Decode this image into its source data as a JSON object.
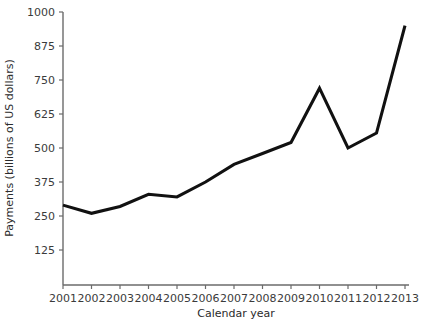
{
  "chart_data": {
    "type": "line",
    "title": "",
    "xlabel": "Calendar year",
    "ylabel": "Payments (billions of US dollars)",
    "categories": [
      "2001",
      "2002",
      "2003",
      "2004",
      "2005",
      "2006",
      "2007",
      "2008",
      "2009",
      "2010",
      "2011",
      "2012",
      "2013"
    ],
    "x": [
      2001,
      2002,
      2003,
      2004,
      2005,
      2006,
      2007,
      2008,
      2009,
      2010,
      2011,
      2012,
      2013
    ],
    "values": [
      290,
      260,
      285,
      330,
      320,
      375,
      440,
      480,
      520,
      720,
      500,
      555,
      950
    ],
    "series": [
      {
        "name": "Payments",
        "values": [
          290,
          260,
          285,
          330,
          320,
          375,
          440,
          480,
          520,
          720,
          500,
          555,
          950
        ],
        "color": "#111111"
      }
    ],
    "ylim": [
      0,
      1000
    ],
    "xlim": [
      2001,
      2013
    ],
    "y_ticks": [
      125,
      250,
      375,
      500,
      625,
      750,
      875,
      1000
    ],
    "y_tick_labels": [
      "125",
      "250",
      "375",
      "500",
      "625",
      "750",
      "875",
      "1000"
    ],
    "x_ticks": [
      2001,
      2002,
      2003,
      2004,
      2005,
      2006,
      2007,
      2008,
      2009,
      2010,
      2011,
      2012,
      2013
    ],
    "x_tick_labels": [
      "2001",
      "2002",
      "2003",
      "2004",
      "2005",
      "2006",
      "2007",
      "2008",
      "2009",
      "2010",
      "2011",
      "2012",
      "2013"
    ],
    "grid": false,
    "legend": false,
    "legend_position": "none",
    "line_color": "#111111",
    "axis_color": "#6b6b6b",
    "background_color": "#ffffff"
  }
}
